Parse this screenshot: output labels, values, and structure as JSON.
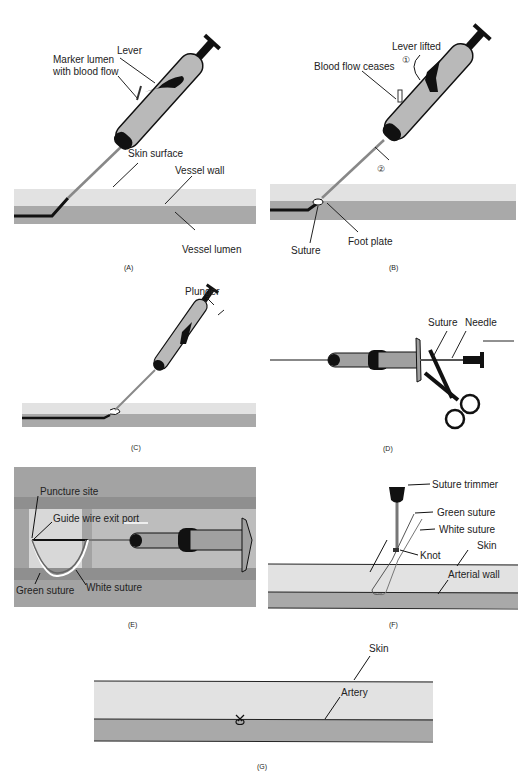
{
  "colors": {
    "skin_layer": "#e2e2e2",
    "lumen_layer": "#a9a9a9",
    "device_body": "#b9b9b9",
    "device_dark": "#111111",
    "panel_e_bg": "#a3a3a3",
    "panel_e_window": "#d8d8d8",
    "panel_e_light": "#bdbdbd",
    "line": "#1a1a1a"
  },
  "panels": {
    "A": {
      "caption": "(A)",
      "labels": {
        "lever": "Lever",
        "marker_line1": "Marker lumen",
        "marker_line2": "with blood flow",
        "skin": "Skin surface",
        "vessel_wall": "Vessel wall",
        "vessel_lumen": "Vessel lumen"
      }
    },
    "B": {
      "caption": "(B)",
      "labels": {
        "lever_lifted": "Lever lifted",
        "step1": "①",
        "blood_flow": "Blood flow ceases",
        "step2": "②",
        "suture": "Suture",
        "foot_plate": "Foot plate"
      }
    },
    "C": {
      "caption": "(C)",
      "labels": {
        "plunger": "Plunger"
      }
    },
    "D": {
      "caption": "(D)",
      "labels": {
        "suture": "Suture",
        "needle": "Needle"
      }
    },
    "E": {
      "caption": "(E)",
      "labels": {
        "puncture": "Puncture site",
        "guide_wire": "Guide wire exit port",
        "green_suture": "Green suture",
        "white_suture": "White suture"
      }
    },
    "F": {
      "caption": "(F)",
      "labels": {
        "trimmer": "Suture trimmer",
        "green_suture": "Green suture",
        "white_suture": "White suture",
        "knot": "Knot",
        "skin": "Skin",
        "arterial_wall": "Arterial wall"
      }
    },
    "G": {
      "caption": "(G)",
      "labels": {
        "skin": "Skin",
        "artery": "Artery"
      }
    }
  }
}
